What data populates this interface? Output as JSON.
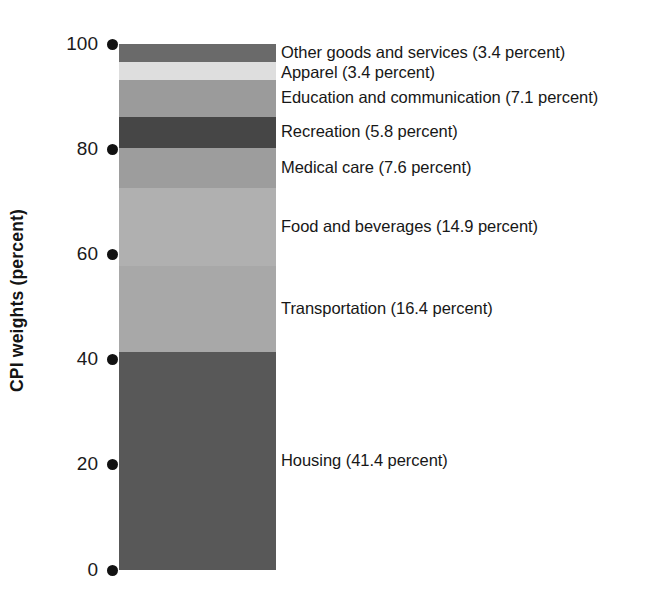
{
  "chart_data": {
    "type": "bar",
    "subtype": "stacked-bar-100-percent",
    "title": "",
    "xlabel": "",
    "ylabel": "CPI weights (percent)",
    "ylim": [
      0,
      100
    ],
    "grid": false,
    "legend_position": "right-inline-annotations",
    "categories": [
      "CPI"
    ],
    "orientation": "vertical",
    "y_ticks": [
      {
        "value": "100",
        "pct": 100
      },
      {
        "value": "80",
        "pct": 80
      },
      {
        "value": "60",
        "pct": 60
      },
      {
        "value": "40",
        "pct": 40
      },
      {
        "value": "20",
        "pct": 20
      },
      {
        "value": "0",
        "pct": 0
      }
    ],
    "series": [
      {
        "name": "Housing",
        "label": "Housing (41.4 percent)",
        "value": 41.4,
        "cumulative_bottom": 0.0,
        "cumulative_top": 41.4,
        "color": "#585858"
      },
      {
        "name": "Transportation",
        "label": "Transportation (16.4 percent)",
        "value": 16.4,
        "cumulative_bottom": 41.4,
        "cumulative_top": 57.8,
        "color": "#a8a8a8"
      },
      {
        "name": "Food and beverages",
        "label": "Food and beverages (14.9 percent)",
        "value": 14.9,
        "cumulative_bottom": 57.8,
        "cumulative_top": 72.7,
        "color": "#b0b0b0"
      },
      {
        "name": "Medical care",
        "label": "Medical care (7.6 percent)",
        "value": 7.6,
        "cumulative_bottom": 72.7,
        "cumulative_top": 80.3,
        "color": "#9d9d9d"
      },
      {
        "name": "Recreation",
        "label": "Recreation (5.8 percent)",
        "value": 5.8,
        "cumulative_bottom": 80.3,
        "cumulative_top": 86.1,
        "color": "#464646"
      },
      {
        "name": "Education and communication",
        "label": "Education and communication (7.1 percent)",
        "value": 7.1,
        "cumulative_bottom": 86.1,
        "cumulative_top": 93.2,
        "color": "#9b9b9b"
      },
      {
        "name": "Apparel",
        "label": "Apparel (3.4 percent)",
        "value": 3.4,
        "cumulative_bottom": 93.2,
        "cumulative_top": 96.6,
        "color": "#dedede"
      },
      {
        "name": "Other goods and services",
        "label": "Other goods and services (3.4 percent)",
        "value": 3.4,
        "cumulative_bottom": 96.6,
        "cumulative_top": 100.0,
        "color": "#6a6a6a"
      }
    ],
    "colors": {
      "background": "#ffffff",
      "tick_dot": "#111111",
      "text": "#1a1a1a"
    }
  }
}
